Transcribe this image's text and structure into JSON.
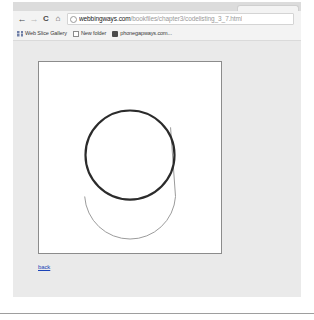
{
  "browser": {
    "tab": {
      "title": ""
    },
    "nav": {
      "back_icon": "arrow-left-icon",
      "back_glyph": "←",
      "forward_icon": "arrow-right-icon",
      "forward_glyph": "→",
      "reload_icon": "reload-icon",
      "reload_glyph": "C",
      "home_icon": "home-icon",
      "home_glyph": "⌂"
    },
    "omnibox": {
      "page_info_icon": "info-circle-icon",
      "host": "webbingways.com",
      "path": "/bookfiles/chapter3/codelisting_3_7.html",
      "full_url": "webbingways.com/bookfiles/chapter3/codelisting_3_7.html",
      "placeholder": "Search Google or type a URL"
    },
    "bookmarks": [
      {
        "label": "Web Slice Gallery",
        "icon": "grid-icon",
        "icon_style": "grid"
      },
      {
        "label": "New folder",
        "icon": "folder-icon",
        "icon_style": "folder"
      },
      {
        "label": "phonegapways.com...",
        "icon": "bookmark-icon",
        "icon_style": "dark"
      }
    ]
  },
  "page": {
    "canvas": {
      "name": "html5-canvas-drawing",
      "background": "#ffffff",
      "border_color": "#8c8c8c",
      "shapes": [
        {
          "name": "main-circle",
          "type": "circle",
          "cx": 92,
          "cy": 94,
          "r": 45,
          "stroke": "#2b2b2b",
          "stroke_width": 2.2,
          "fill": "none"
        },
        {
          "name": "lower-arc",
          "type": "arc",
          "cx": 92,
          "cy": 140,
          "r": 46,
          "start_angle_deg": 185,
          "end_angle_deg": 355,
          "stroke": "#9a9a9a",
          "stroke_width": 1,
          "fill": "none"
        },
        {
          "name": "arc-path-lead-line",
          "type": "line",
          "x1": 138,
          "y1": 136,
          "x2": 133,
          "y2": 66,
          "stroke": "#9a9a9a",
          "stroke_width": 1
        }
      ]
    },
    "back_link": {
      "label": "back",
      "color": "#1b44b8"
    }
  }
}
